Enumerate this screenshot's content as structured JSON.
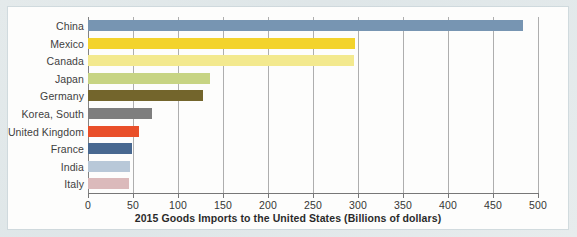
{
  "chart_data": {
    "type": "bar",
    "orientation": "horizontal",
    "title": "",
    "xlabel": "2015 Goods Imports to the United States (Billions of dollars)",
    "ylabel": "",
    "xlim": [
      0,
      500
    ],
    "xticks": [
      0,
      50,
      100,
      150,
      200,
      250,
      300,
      350,
      400,
      450,
      500
    ],
    "grid": true,
    "legend": "none",
    "categories": [
      "China",
      "Mexico",
      "Canada",
      "Japan",
      "Germany",
      "Korea, South",
      "United Kingdom",
      "France",
      "India",
      "Italy"
    ],
    "values": [
      483,
      297,
      296,
      136,
      128,
      71,
      57,
      49,
      47,
      46
    ],
    "colors": [
      "#6f8fae",
      "#f3d11f",
      "#f3e887",
      "#c4d27c",
      "#6b5c1f",
      "#767676",
      "#e8451c",
      "#3d5f8a",
      "#b4c5d6",
      "#d9b6b7"
    ]
  },
  "figure": {
    "background_color": "#dfe6e8",
    "card_color": "#fdfdfc",
    "gridline_color": "#a9a9a9",
    "axis_color": "#6f6f6f"
  }
}
